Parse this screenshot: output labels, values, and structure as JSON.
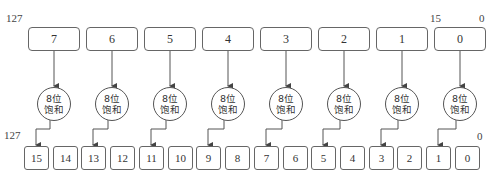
{
  "labels": {
    "top_left_msb": "127",
    "top_right_msb": "15",
    "top_right_lsb": "0",
    "bottom_left_msb": "127",
    "bottom_right_lsb": "0"
  },
  "source_lanes": [
    "7",
    "6",
    "5",
    "4",
    "3",
    "2",
    "1",
    "0"
  ],
  "saturate_units": [
    {
      "line1": "8位",
      "line2": "饱和"
    },
    {
      "line1": "8位",
      "line2": "饱和"
    },
    {
      "line1": "8位",
      "line2": "饱和"
    },
    {
      "line1": "8位",
      "line2": "饱和"
    },
    {
      "line1": "8位",
      "line2": "饱和"
    },
    {
      "line1": "8位",
      "line2": "饱和"
    },
    {
      "line1": "8位",
      "line2": "饱和"
    },
    {
      "line1": "8位",
      "line2": "饱和"
    }
  ],
  "dest_lanes": [
    "15",
    "14",
    "13",
    "12",
    "11",
    "10",
    "9",
    "8",
    "7",
    "6",
    "5",
    "4",
    "3",
    "2",
    "1",
    "0"
  ],
  "colors": {
    "stroke": "#555555",
    "text": "#333333",
    "background": "#ffffff"
  }
}
